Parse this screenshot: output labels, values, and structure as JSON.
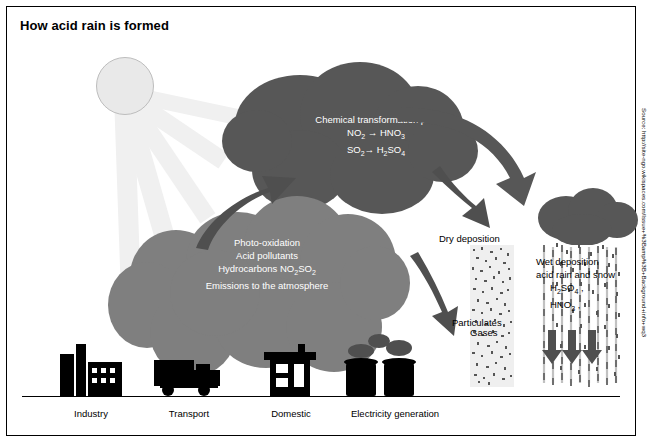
{
  "title": "How acid rain is formed",
  "source": "Source: http://site-ngo.wikispaces.com/Issue+%3Bamp%3B+Background+info+wq3",
  "clouds": {
    "upper": {
      "lines": [
        "Chemical transformation pan",
        "NO2 → HNO3",
        "SO2→ H2SO4"
      ],
      "line1": "Chemical transformation pan",
      "line2_a": "NO",
      "line2_sub": "2",
      "line2_b": " → HNO",
      "line2_sub2": "3",
      "line3_a": "SO",
      "line3_sub": "2",
      "line3_b": "→ H",
      "line3_sub2": "2",
      "line3_c": "SO",
      "line3_sub3": "4"
    },
    "lower": {
      "line1": "Photo-oxidation",
      "line2": "Acid pollutants",
      "line3_a": "Hydrocarbons NO",
      "line3_sub": "2",
      "line3_b": "SO",
      "line3_sub2": "2",
      "line4": "Emissions to the atmosphere"
    }
  },
  "labels": {
    "dry_deposition": "Dry deposition",
    "particulates": "Particulates",
    "gases": "Gases",
    "wet_line1": "Wet deposition",
    "wet_line2": "acid rain and snow",
    "wet_line3_a": "H",
    "wet_line3_sub": "2",
    "wet_line3_b": "SO",
    "wet_line3_sub2": "4",
    "wet_line3_c": " ,",
    "wet_line4_a": "HNO",
    "wet_line4_sub": "3",
    "wet_line4_b": " ,"
  },
  "captions": [
    {
      "label": "Industry"
    },
    {
      "label": "Transport"
    },
    {
      "label": "Domestic"
    },
    {
      "label": "Electricity generation"
    }
  ],
  "colors": {
    "cloud_dark": "#575757",
    "cloud_mid": "#7f7f7f",
    "sun": "#e9e9e9",
    "ray": "#f0f0f0",
    "panel": "#efefef",
    "ink": "#000000"
  }
}
